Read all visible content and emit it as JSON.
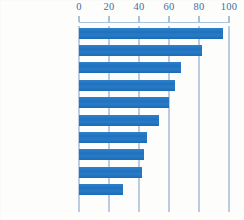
{
  "chart_data": {
    "type": "bar",
    "orientation": "horizontal",
    "title": "",
    "subtitle": "",
    "xlabel": "",
    "ylabel": "",
    "xlim": [
      0,
      100
    ],
    "ylim": null,
    "grid": true,
    "legend": null,
    "legend_position": "none",
    "xticks": [
      0,
      20,
      40,
      60,
      80,
      100
    ],
    "xtick_labels": [
      "0",
      "20",
      "40",
      "60",
      "80",
      "100"
    ],
    "categories": [
      "Greece",
      "Netherlands",
      "Italy",
      "Sweden",
      "OECD average",
      "France",
      "Australia",
      "United States",
      "Germany",
      "Britain"
    ],
    "values": [
      96,
      82,
      68,
      64,
      60,
      53,
      45,
      43,
      42,
      29
    ],
    "bar_color": "#2176c4",
    "text_color": "#41699a",
    "gridline_color": "#7b9cc0",
    "annotations": []
  },
  "axis": {
    "ticks": [
      {
        "label": "0",
        "value": 0
      },
      {
        "label": "20",
        "value": 20
      },
      {
        "label": "40",
        "value": 40
      },
      {
        "label": "60",
        "value": 60
      },
      {
        "label": "80",
        "value": 80
      },
      {
        "label": "100",
        "value": 100
      }
    ]
  },
  "rows": [
    {
      "label": "Greece",
      "value": 96
    },
    {
      "label": "Netherlands",
      "value": 82
    },
    {
      "label": "Italy",
      "value": 68
    },
    {
      "label": "Sweden",
      "value": 64
    },
    {
      "label": "OECD average",
      "value": 60
    },
    {
      "label": "France",
      "value": 53
    },
    {
      "label": "Australia",
      "value": 45
    },
    {
      "label": "United States",
      "value": 43
    },
    {
      "label": "Germany",
      "value": 42
    },
    {
      "label": "Britain",
      "value": 29
    }
  ]
}
